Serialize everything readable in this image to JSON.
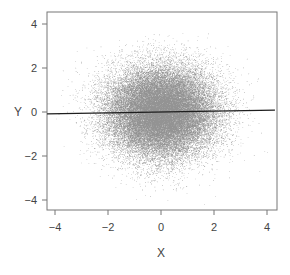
{
  "chart_data": {
    "type": "scatter",
    "title": "",
    "xlabel": "X",
    "ylabel": "Y",
    "xlim": [
      -4.3,
      4.3
    ],
    "ylim": [
      -4.5,
      4.5
    ],
    "xticks": [
      -4,
      -2,
      0,
      2,
      4
    ],
    "yticks": [
      -4,
      -2,
      0,
      2,
      4
    ],
    "xtick_labels": [
      "−4",
      "−2",
      "0",
      "2",
      "4"
    ],
    "ytick_labels": [
      "−4",
      "−2",
      "0",
      "2",
      "4"
    ],
    "grid": false,
    "legend": null,
    "series": [
      {
        "name": "points",
        "distribution": "bivariate standard normal (X ~ N(0,1), Y ~ N(0,1), independent)",
        "n_points": 40000,
        "mean": [
          0,
          0
        ],
        "sd": [
          1,
          1
        ],
        "marker_color": "#3a3a3a",
        "marker_size": 0.6
      }
    ],
    "regression_line": {
      "intercept": 0.0,
      "slope": 0.02,
      "color": "#1e1e1e",
      "x_range": [
        -4.3,
        4.3
      ]
    }
  },
  "colors": {
    "frame": "#777777",
    "ticks": "#777777",
    "background": "#ffffff"
  }
}
